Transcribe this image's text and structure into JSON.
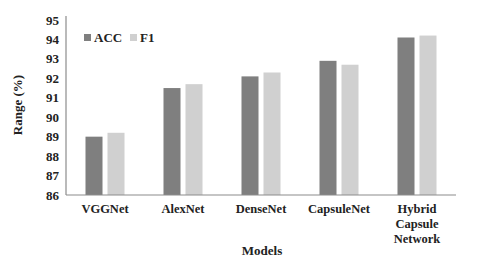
{
  "chart_data": {
    "type": "bar",
    "title": "",
    "xlabel": "Models",
    "ylabel": "Range (%)",
    "ylim": [
      86,
      95
    ],
    "yticks": [
      86,
      87,
      88,
      89,
      90,
      91,
      92,
      93,
      94,
      95
    ],
    "grid": false,
    "legend_position": "top-left",
    "categories": [
      "VGGNet",
      "AlexNet",
      "DenseNet",
      "CapsuleNet",
      "Hybrid Capsule Network"
    ],
    "category_lines": [
      [
        "VGGNet"
      ],
      [
        "AlexNet"
      ],
      [
        "DenseNet"
      ],
      [
        "CapsuleNet"
      ],
      [
        "Hybrid",
        "Capsule",
        "Network"
      ]
    ],
    "series": [
      {
        "name": "ACC",
        "color": "#7f7f7f",
        "values": [
          89.0,
          91.5,
          92.1,
          92.9,
          94.1
        ]
      },
      {
        "name": "F1",
        "color": "#d0d0d0",
        "values": [
          89.2,
          91.7,
          92.3,
          92.7,
          94.2
        ]
      }
    ]
  }
}
